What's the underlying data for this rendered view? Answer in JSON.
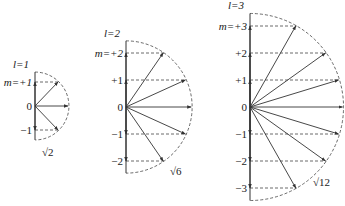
{
  "colors": {
    "line": "#333333",
    "dash": "#444444",
    "text": "#222222"
  },
  "diagrams": [
    {
      "l_label": "l=1",
      "l": 1,
      "origin": [
        35,
        106
      ],
      "unit": 24,
      "m_labels": [
        "m=+1",
        "0",
        "−1"
      ],
      "m_values": [
        1,
        0,
        -1
      ],
      "magnitude_label": "√2",
      "magnitude_pos": [
        42,
        156
      ]
    },
    {
      "l_label": "l=2",
      "l": 2,
      "origin": [
        126,
        107
      ],
      "unit": 27,
      "m_labels": [
        "m=+2",
        "+1",
        "0",
        "−1",
        "−2"
      ],
      "m_values": [
        2,
        1,
        0,
        -1,
        -2
      ],
      "magnitude_label": "√6",
      "magnitude_pos": [
        170,
        175
      ]
    },
    {
      "l_label": "l=3",
      "l": 3,
      "origin": [
        250,
        107
      ],
      "unit": 27,
      "m_labels": [
        "m=+3",
        "+2",
        "+1",
        "0",
        "−1",
        "−2",
        "−3"
      ],
      "m_values": [
        3,
        2,
        1,
        0,
        -1,
        -2,
        -3
      ],
      "magnitude_label": "√12",
      "magnitude_pos": [
        313,
        186
      ]
    }
  ]
}
